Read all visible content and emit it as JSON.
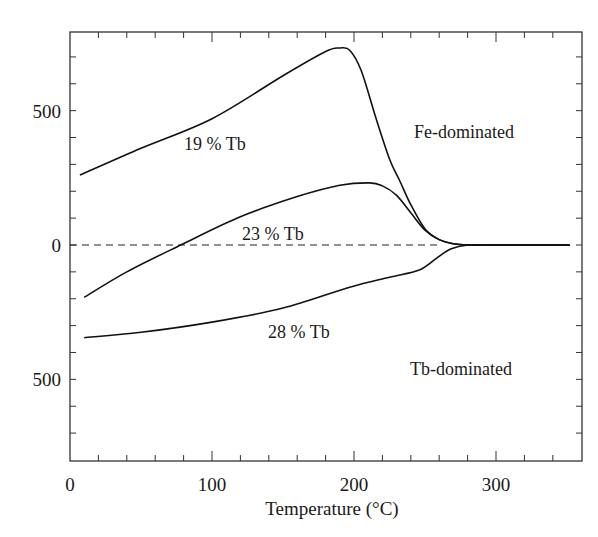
{
  "chart_data": {
    "type": "line",
    "title": "",
    "xlabel": "Temperature (°C)",
    "ylabel": "",
    "xlim": [
      0,
      360
    ],
    "ylim": [
      -800,
      800
    ],
    "x_ticks": [
      0,
      100,
      200,
      300
    ],
    "x_tick_labels": [
      "0",
      "100",
      "200",
      "300"
    ],
    "y_ticks": [
      500,
      0,
      -500
    ],
    "y_tick_labels": [
      "500",
      "0",
      "500"
    ],
    "grid": false,
    "legend": null,
    "zero_line": {
      "style": "dashed",
      "y": 0
    },
    "series": [
      {
        "name": "19 % Tb",
        "x": [
          7,
          50,
          100,
          150,
          180,
          190,
          197,
          205,
          215,
          225,
          232,
          240,
          250,
          260,
          270,
          280,
          300,
          352
        ],
        "y": [
          260,
          360,
          470,
          630,
          720,
          733,
          725,
          650,
          480,
          320,
          242,
          150,
          60,
          20,
          5,
          0,
          0,
          0
        ]
      },
      {
        "name": "23 % Tb",
        "x": [
          10,
          40,
          78,
          120,
          160,
          190,
          211,
          220,
          230,
          240,
          250,
          260,
          270,
          280,
          300,
          352
        ],
        "y": [
          -195,
          -100,
          0,
          105,
          180,
          222,
          231,
          220,
          185,
          120,
          55,
          20,
          5,
          0,
          0,
          0
        ]
      },
      {
        "name": "28 % Tb",
        "x": [
          10,
          50,
          100,
          150,
          197,
          225,
          246,
          258,
          268,
          280,
          300,
          352
        ],
        "y": [
          -345,
          -325,
          -287,
          -235,
          -157,
          -120,
          -93,
          -50,
          -15,
          0,
          0,
          0
        ]
      }
    ],
    "annotations": [
      {
        "text": "19 % Tb",
        "x": 100,
        "y": 380
      },
      {
        "text": "23 % Tb",
        "x": 155,
        "y": 35
      },
      {
        "text": "28 % Tb",
        "x": 170,
        "y": -420
      },
      {
        "text": "Fe-dominated",
        "x": 270,
        "y": 430
      },
      {
        "text": "Tb-dominated",
        "x": 270,
        "y": -400
      }
    ]
  },
  "labels": {
    "x_axis": "Temperature (°C)",
    "x_ticks": [
      "0",
      "100",
      "200",
      "300"
    ],
    "y_ticks": [
      "500",
      "0",
      "500"
    ],
    "curve_19": "19 % Tb",
    "curve_23": "23 % Tb",
    "curve_28": "28 % Tb",
    "region_fe": "Fe-dominated",
    "region_tb": "Tb-dominated"
  }
}
